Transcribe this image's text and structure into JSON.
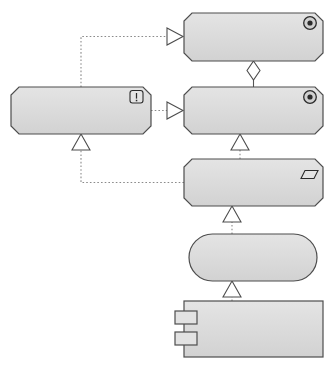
{
  "diagram": {
    "background_color": "#ffffff",
    "node_fill": "#d9d9d9",
    "node_fill_light": "#e0e0e0",
    "node_stroke": "#4d4d4d",
    "edge_color": "#7a7a7a",
    "text_color": "#111111"
  },
  "nodes": [
    {
      "id": "reduce-interaction",
      "name": "reduce-interaction-with-customer",
      "label": "Reduce interaction\nwith customer",
      "shape": "octagon",
      "icon": "goal-bullseye-icon",
      "font_size": 11.5,
      "x": 184,
      "y": 13,
      "w": 139,
      "h": 48
    },
    {
      "id": "systems-customer-facing",
      "name": "systems-should-be-customer-facing",
      "label": "Systems should be\ncustomer facing",
      "shape": "octagon",
      "icon": "principle-exclamation-icon",
      "font_size": 11.5,
      "x": 11,
      "y": 87,
      "w": 140,
      "h": 47
    },
    {
      "id": "facilitate-self-service",
      "name": "facilitate-self-service",
      "label": "Facilitate\nself-service",
      "shape": "octagon",
      "icon": "goal-bullseye-icon",
      "font_size": 11.5,
      "x": 184,
      "y": 87,
      "w": 139,
      "h": 47
    },
    {
      "id": "provide-online-portfolio",
      "name": "provide-on-line-portfolio-service",
      "label": "Provide on-line\nportfolio service",
      "shape": "octagon",
      "icon": "requirement-parallelogram-icon",
      "font_size": 11.5,
      "x": 184,
      "y": 159,
      "w": 139,
      "h": 47
    },
    {
      "id": "online-portfolio-service",
      "name": "on-line-portfolio-service",
      "label": "On-line\nportfolio service",
      "shape": "stadium",
      "icon": "none",
      "font_size": 11.5,
      "x": 189,
      "y": 234,
      "w": 128,
      "h": 47
    },
    {
      "id": "portfolio-mgmt-app",
      "name": "portfolio-management-application",
      "label": "Portfolio management\napplication",
      "shape": "component",
      "icon": "component-tabs-icon",
      "font_size": 11.5,
      "x": 184,
      "y": 301,
      "w": 139,
      "h": 56
    }
  ],
  "edges": [
    {
      "id": "e1",
      "name": "edge-systems-to-reduce-interaction",
      "from": "systems-customer-facing",
      "to": "reduce-interaction",
      "style": "dotted",
      "arrow": "hollow-triangle",
      "relation": "influence-realization"
    },
    {
      "id": "e2",
      "name": "edge-facilitate-to-reduce-interaction",
      "from": "facilitate-self-service",
      "to": "reduce-interaction",
      "style": "solid",
      "arrow": "hollow-diamond",
      "relation": "aggregation"
    },
    {
      "id": "e3",
      "name": "edge-systems-to-facilitate",
      "from": "systems-customer-facing",
      "to": "facilitate-self-service",
      "style": "dotted",
      "arrow": "hollow-triangle",
      "relation": "realization"
    },
    {
      "id": "e4",
      "name": "edge-provide-to-facilitate",
      "from": "provide-online-portfolio",
      "to": "facilitate-self-service",
      "style": "dotted",
      "arrow": "hollow-triangle",
      "relation": "realization"
    },
    {
      "id": "e5",
      "name": "edge-provide-to-systems",
      "from": "provide-online-portfolio",
      "to": "systems-customer-facing",
      "style": "dotted",
      "arrow": "hollow-triangle",
      "relation": "realization"
    },
    {
      "id": "e6",
      "name": "edge-service-to-provide",
      "from": "online-portfolio-service",
      "to": "provide-online-portfolio",
      "style": "dotted",
      "arrow": "hollow-triangle",
      "relation": "realization"
    },
    {
      "id": "e7",
      "name": "edge-app-to-service",
      "from": "portfolio-mgmt-app",
      "to": "online-portfolio-service",
      "style": "dotted",
      "arrow": "hollow-triangle",
      "relation": "realization"
    }
  ]
}
